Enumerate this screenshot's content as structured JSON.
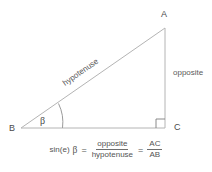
{
  "diagram": {
    "vertices": [
      {
        "id": "A",
        "label": "A",
        "x": 165,
        "y": 28
      },
      {
        "id": "B",
        "label": "B",
        "x": 21,
        "y": 128
      },
      {
        "id": "C",
        "label": "C",
        "x": 165,
        "y": 128
      }
    ],
    "sides": [
      {
        "id": "hypotenuse",
        "label": "hypotenuse",
        "from": "B",
        "to": "A"
      },
      {
        "id": "opposite",
        "label": "opposite",
        "from": "A",
        "to": "C"
      },
      {
        "id": "adjacent",
        "label": "",
        "from": "B",
        "to": "C"
      }
    ],
    "angle": {
      "label": "β",
      "at_vertex": "B",
      "marker": "arc"
    },
    "right_angle": {
      "at_vertex": "C",
      "marker": "square"
    },
    "line_color": "#b4b4b4",
    "text_color": "#4a4a4a",
    "background": "#ffffff"
  },
  "formula": {
    "function_name": "sin(e)",
    "variable": "β",
    "equals": "=",
    "ratio_1": {
      "numerator": "opposite",
      "denominator": "hypotenuse"
    },
    "equals_2": "=",
    "ratio_2": {
      "numerator": "AC",
      "denominator": "AB"
    }
  }
}
